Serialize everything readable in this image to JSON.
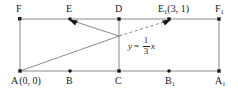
{
  "figure": {
    "type": "geometry-diagram",
    "colors": {
      "line": "#8a8a8a",
      "accent": "#1a1a1a",
      "background": "#ffffff"
    },
    "equation": {
      "lhs": "y",
      "equals": "=",
      "numerator": "1",
      "denominator": "3",
      "variable": "x",
      "full_text": "y = 1/3 x"
    },
    "labels": {
      "F": "F",
      "E": "E",
      "D": "D",
      "E1": "E",
      "E1_sub": "1",
      "E1_coords": "(3, 1)",
      "F1": "F",
      "F1_sub": "1",
      "A": "A",
      "A_coords": "(0, 0)",
      "B": "B",
      "C": "C",
      "B1": "B",
      "B1_sub": "1",
      "A1": "A",
      "A1_sub": "1"
    },
    "points": [
      {
        "name": "F",
        "x": 20,
        "y": 19
      },
      {
        "name": "E",
        "x": 70,
        "y": 19
      },
      {
        "name": "D",
        "x": 119,
        "y": 19
      },
      {
        "name": "E1",
        "x": 169,
        "y": 19
      },
      {
        "name": "F1",
        "x": 219,
        "y": 19
      },
      {
        "name": "A",
        "x": 20,
        "y": 71
      },
      {
        "name": "B",
        "x": 70,
        "y": 71
      },
      {
        "name": "C",
        "x": 119,
        "y": 71
      },
      {
        "name": "B1",
        "x": 169,
        "y": 71
      },
      {
        "name": "A1",
        "x": 219,
        "y": 71
      }
    ]
  }
}
